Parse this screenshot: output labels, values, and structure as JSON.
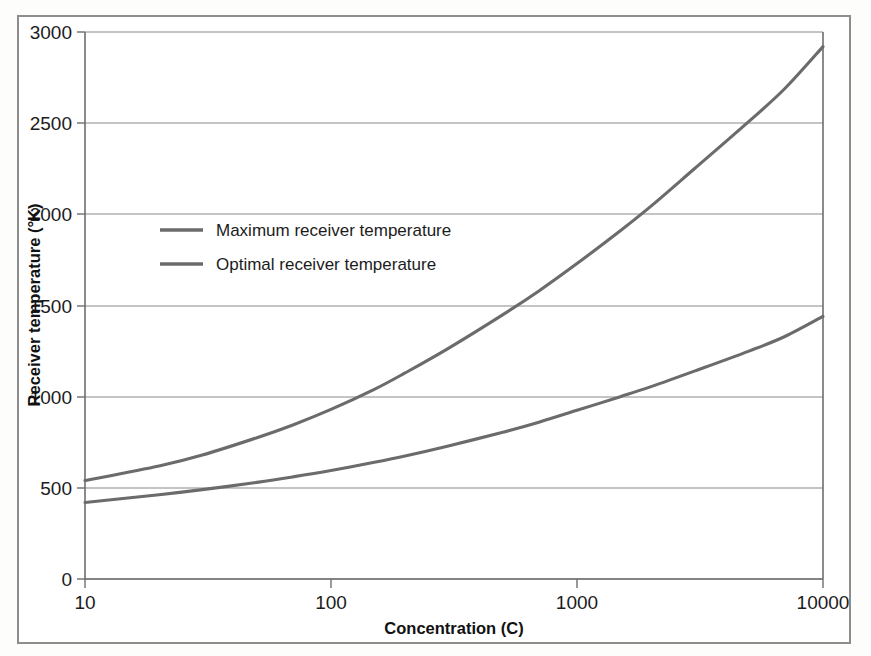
{
  "chart_data": {
    "type": "line",
    "title": "",
    "xlabel": "Concentration (C)",
    "ylabel": "Receiver temperature (°K)",
    "xscale": "log",
    "yscale": "linear",
    "xlim": [
      10,
      10000
    ],
    "ylim": [
      0,
      3000
    ],
    "xticks": [
      10,
      100,
      1000,
      10000
    ],
    "xtick_labels": [
      "10",
      "100",
      "1000",
      "10000"
    ],
    "yticks": [
      0,
      500,
      1000,
      1500,
      2000,
      2500,
      3000
    ],
    "ytick_labels": [
      "0",
      "500",
      "1000",
      "1500",
      "2000",
      "2500",
      "3000"
    ],
    "grid": true,
    "grid_axis": "y",
    "legend_position": "upper left inside",
    "line_color": "#6b6b6b",
    "grid_color": "#8a8a8a",
    "axis_color": "#6e6e6e",
    "background_color": "#ffffff",
    "series": [
      {
        "name": "Maximum receiver temperature",
        "x": [
          10,
          20,
          30,
          50,
          70,
          100,
          150,
          200,
          300,
          500,
          700,
          1000,
          1500,
          2000,
          3000,
          5000,
          7000,
          10000
        ],
        "values": [
          540,
          620,
          680,
          775,
          845,
          930,
          1040,
          1130,
          1265,
          1450,
          1580,
          1730,
          1910,
          2045,
          2250,
          2510,
          2690,
          2920
        ]
      },
      {
        "name": "Optimal receiver temperature",
        "x": [
          10,
          20,
          30,
          50,
          70,
          100,
          150,
          200,
          300,
          500,
          700,
          1000,
          1500,
          2000,
          3000,
          5000,
          7000,
          10000
        ],
        "values": [
          420,
          462,
          490,
          530,
          560,
          595,
          640,
          675,
          730,
          805,
          860,
          925,
          1000,
          1055,
          1140,
          1250,
          1330,
          1440
        ]
      }
    ]
  },
  "legend": {
    "items": [
      {
        "label": "Maximum receiver temperature"
      },
      {
        "label": "Optimal receiver temperature"
      }
    ]
  }
}
